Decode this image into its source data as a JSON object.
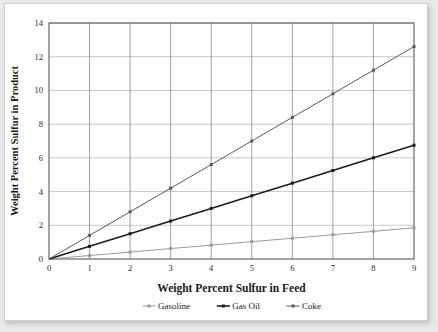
{
  "chart_data": {
    "type": "line",
    "title": "",
    "xlabel": "Weight Percent Sulfur in Feed",
    "ylabel": "Weight Percent Sulfur in Product",
    "x": [
      0,
      1,
      2,
      3,
      4,
      5,
      6,
      7,
      8,
      9
    ],
    "xlim": [
      0,
      9
    ],
    "ylim": [
      0,
      14
    ],
    "xticks": [
      "0",
      "1",
      "2",
      "3",
      "4",
      "5",
      "6",
      "7",
      "8",
      "9"
    ],
    "yticks": [
      "0",
      "2",
      "4",
      "6",
      "8",
      "10",
      "12",
      "14"
    ],
    "grid": "both",
    "legend_position": "bottom",
    "series": [
      {
        "name": "Gasoline",
        "color": "#9a9a9a",
        "marker": "square",
        "values": [
          0,
          0.205,
          0.41,
          0.62,
          0.82,
          1.03,
          1.23,
          1.44,
          1.64,
          1.85
        ]
      },
      {
        "name": "Gas Oil",
        "color": "#1c1c1c",
        "marker": "square",
        "values": [
          0,
          0.75,
          1.5,
          2.25,
          3.0,
          3.75,
          4.5,
          5.25,
          6.0,
          6.75
        ]
      },
      {
        "name": "Coke",
        "color": "#595959",
        "marker": "square",
        "values": [
          0,
          1.4,
          2.8,
          4.2,
          5.6,
          7.0,
          8.4,
          9.8,
          11.2,
          12.6
        ]
      }
    ]
  },
  "colors": {
    "page_background": "#e9e9e9",
    "figure_background": "#ffffff",
    "plot_border": "#4a4a4a",
    "gridline_horizontal": "#c8c8c8",
    "gridline_vertical": "#8a8a8a",
    "text": "#1a1a1a"
  }
}
